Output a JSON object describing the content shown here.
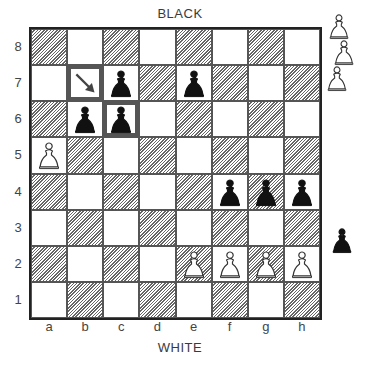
{
  "labels": {
    "top": "BLACK",
    "bottom": "WHITE"
  },
  "ranks": [
    "8",
    "7",
    "6",
    "5",
    "4",
    "3",
    "2",
    "1"
  ],
  "files": [
    "a",
    "b",
    "c",
    "d",
    "e",
    "f",
    "g",
    "h"
  ],
  "colors": {
    "dark_hatch": "#666666",
    "frame": "#555555",
    "black_piece": "#111111",
    "white_piece_outline": "#333333"
  },
  "position": {
    "black_pawns": [
      "c7",
      "e7",
      "b6",
      "c6",
      "f4",
      "g4",
      "h4"
    ],
    "white_pawns": [
      "a5",
      "e2",
      "f2",
      "g2",
      "h2"
    ]
  },
  "highlights": {
    "framed_squares": [
      "b7",
      "c6"
    ],
    "arrow": {
      "square": "b7",
      "direction": "down-right",
      "icon": "arrow-icon"
    }
  },
  "margin_pieces": [
    {
      "color": "white",
      "piece": "pawn",
      "x": 327,
      "y": 12
    },
    {
      "color": "white",
      "piece": "pawn",
      "x": 332,
      "y": 38
    },
    {
      "color": "white",
      "piece": "pawn",
      "x": 325,
      "y": 64
    },
    {
      "color": "black",
      "piece": "pawn",
      "x": 330,
      "y": 226
    }
  ]
}
